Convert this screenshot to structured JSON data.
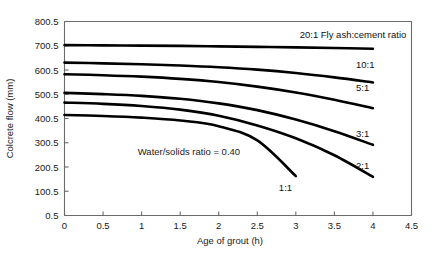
{
  "chart_data": {
    "type": "line",
    "title": "",
    "xlabel": "Age of grout (h)",
    "ylabel": "Colcrete flow (mm)",
    "xlim": [
      0,
      4.5
    ],
    "ylim": [
      0.5,
      800.5
    ],
    "xticks": [
      "0",
      "0.5",
      "1",
      "1.5",
      "2",
      "2.5",
      "3",
      "3.5",
      "4",
      "4.5"
    ],
    "xtick_values": [
      0,
      0.5,
      1,
      1.5,
      2,
      2.5,
      3,
      3.5,
      4,
      4.5
    ],
    "yticks": [
      "0.5",
      "100.5",
      "200.5",
      "300.5",
      "400.5",
      "500.5",
      "600.5",
      "700.5",
      "800.5"
    ],
    "ytick_values": [
      0.5,
      100.5,
      200.5,
      300.5,
      400.5,
      500.5,
      600.5,
      700.5,
      800.5
    ],
    "grid": false,
    "legend_position": "inline-right-of-curve-ends",
    "annotations": [
      {
        "name": "water-solids-annotation",
        "text": "Water/solids ratio = 0.40",
        "x": 0.95,
        "y": 265
      }
    ],
    "series": [
      {
        "name": "20:1",
        "label": "20:1 Fly ash:cement ratio",
        "label_x": 3.05,
        "label_y": 745,
        "points": [
          {
            "x": 0.0,
            "y": 703
          },
          {
            "x": 0.5,
            "y": 702
          },
          {
            "x": 1.0,
            "y": 701
          },
          {
            "x": 1.5,
            "y": 700
          },
          {
            "x": 2.0,
            "y": 698
          },
          {
            "x": 2.5,
            "y": 696
          },
          {
            "x": 3.0,
            "y": 694
          },
          {
            "x": 3.5,
            "y": 691
          },
          {
            "x": 4.0,
            "y": 688
          }
        ]
      },
      {
        "name": "10:1",
        "label": "10:1",
        "label_x": 3.78,
        "label_y": 625,
        "points": [
          {
            "x": 0.0,
            "y": 631
          },
          {
            "x": 0.5,
            "y": 628
          },
          {
            "x": 1.0,
            "y": 624
          },
          {
            "x": 1.5,
            "y": 619
          },
          {
            "x": 2.0,
            "y": 612
          },
          {
            "x": 2.5,
            "y": 602
          },
          {
            "x": 3.0,
            "y": 588
          },
          {
            "x": 3.5,
            "y": 570
          },
          {
            "x": 4.0,
            "y": 549
          }
        ]
      },
      {
        "name": "5:1",
        "label": "5:1",
        "label_x": 3.78,
        "label_y": 527,
        "points": [
          {
            "x": 0.0,
            "y": 583
          },
          {
            "x": 0.5,
            "y": 579
          },
          {
            "x": 1.0,
            "y": 573
          },
          {
            "x": 1.5,
            "y": 564
          },
          {
            "x": 2.0,
            "y": 551
          },
          {
            "x": 2.5,
            "y": 532
          },
          {
            "x": 3.0,
            "y": 508
          },
          {
            "x": 3.5,
            "y": 478
          },
          {
            "x": 4.0,
            "y": 443
          }
        ]
      },
      {
        "name": "3:1",
        "label": "3:1",
        "label_x": 3.78,
        "label_y": 338,
        "points": [
          {
            "x": 0.0,
            "y": 506
          },
          {
            "x": 0.5,
            "y": 501
          },
          {
            "x": 1.0,
            "y": 494
          },
          {
            "x": 1.5,
            "y": 482
          },
          {
            "x": 2.0,
            "y": 463
          },
          {
            "x": 2.5,
            "y": 435
          },
          {
            "x": 3.0,
            "y": 396
          },
          {
            "x": 3.5,
            "y": 348
          },
          {
            "x": 4.0,
            "y": 292
          }
        ]
      },
      {
        "name": "2:1",
        "label": "2:1",
        "label_x": 3.78,
        "label_y": 205,
        "points": [
          {
            "x": 0.0,
            "y": 466
          },
          {
            "x": 0.5,
            "y": 461
          },
          {
            "x": 1.0,
            "y": 452
          },
          {
            "x": 1.5,
            "y": 437
          },
          {
            "x": 2.0,
            "y": 412
          },
          {
            "x": 2.5,
            "y": 372
          },
          {
            "x": 3.0,
            "y": 319
          },
          {
            "x": 3.5,
            "y": 249
          },
          {
            "x": 4.0,
            "y": 160
          }
        ]
      },
      {
        "name": "1:1",
        "label": "1:1",
        "label_x": 2.78,
        "label_y": 118,
        "points": [
          {
            "x": 0.0,
            "y": 415
          },
          {
            "x": 0.5,
            "y": 411
          },
          {
            "x": 1.0,
            "y": 404
          },
          {
            "x": 1.5,
            "y": 392
          },
          {
            "x": 2.0,
            "y": 369
          },
          {
            "x": 2.5,
            "y": 310
          },
          {
            "x": 3.0,
            "y": 163
          }
        ]
      }
    ]
  }
}
